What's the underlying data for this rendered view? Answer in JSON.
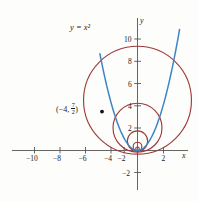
{
  "figure": {
    "name": "parabola-with-tangent-circle-family",
    "background_color": "#fdfdfc",
    "curve_label": "y = x²",
    "point_label_prefix": "(−4, ",
    "point_label_num": "7",
    "point_label_den": "2",
    "point_label_suffix": ")",
    "x_axis_name": "x",
    "y_axis_name": "y"
  },
  "colors": {
    "parabola": "#3d85c6",
    "circles": "#9e3a3a",
    "axis": "#555555",
    "text": "#1a1a1a",
    "point": "#111111"
  },
  "chart_data": {
    "type": "line",
    "title": "",
    "xlabel": "x",
    "ylabel": "y",
    "xlim": [
      -12,
      4.5
    ],
    "ylim": [
      -3,
      11.5
    ],
    "grid": false,
    "legend": "none",
    "x_ticks": [
      -10,
      -8,
      -6,
      -4,
      -2,
      2
    ],
    "x_tick_labels": [
      "−10",
      "−8",
      "−6",
      "−4",
      "−2",
      "2"
    ],
    "y_ticks": [
      -2,
      2,
      4,
      6,
      8,
      10
    ],
    "y_tick_labels": [
      "−2",
      "2",
      "4",
      "6",
      "8",
      "10"
    ],
    "series": [
      {
        "name": "y = x²",
        "type": "parabola",
        "equation": "y = x^2",
        "color": "#3d85c6",
        "x_range": [
          -2.95,
          3.3
        ]
      }
    ],
    "circles": [
      {
        "name": "circle-1",
        "cx": 0,
        "cy": 4.52,
        "r": 4.52,
        "color": "#9e3a3a"
      },
      {
        "name": "circle-2",
        "cx": 0,
        "cy": 2.05,
        "r": 2.05,
        "color": "#9e3a3a"
      },
      {
        "name": "circle-3",
        "cx": 0,
        "cy": 0.85,
        "r": 0.85,
        "color": "#9e3a3a"
      },
      {
        "name": "circle-4",
        "cx": 0,
        "cy": 0.36,
        "r": 0.36,
        "color": "#9e3a3a"
      },
      {
        "name": "circle-5",
        "cx": 0,
        "cy": 0.15,
        "r": 0.15,
        "color": "#9e3a3a"
      }
    ],
    "annotations": [
      {
        "name": "curve-label",
        "text": "y = x²",
        "x": -5.2,
        "y": 10.2
      },
      {
        "name": "marked-point",
        "text": "(−4, 7/2)",
        "x": -4,
        "y": 3.5,
        "marker": "filled-dot"
      }
    ]
  }
}
